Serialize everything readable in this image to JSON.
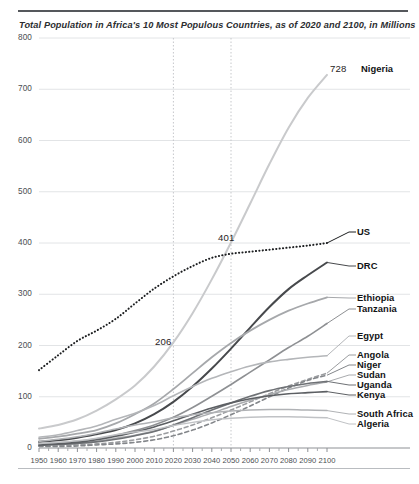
{
  "title": "Total Population in Africa's 10 Most Populous Countries, as of 2020 and 2100, in Millions",
  "annotations": [
    {
      "text": "728",
      "x": 2100,
      "y": 728
    },
    {
      "text": "401",
      "x": 2050,
      "y": 401
    },
    {
      "text": "206",
      "x": 2020,
      "y": 206
    }
  ],
  "chart_data": {
    "type": "line",
    "title": "Total Population in Africa's 10 Most Populous Countries, as of 2020 and 2100, in Millions",
    "xlabel": "",
    "ylabel": "",
    "xlim": [
      1950,
      2100
    ],
    "ylim": [
      0,
      800
    ],
    "yticks": [
      0,
      100,
      200,
      300,
      400,
      500,
      600,
      700,
      800
    ],
    "xticks": [
      1950,
      1960,
      1970,
      1980,
      1990,
      2000,
      2010,
      2020,
      2030,
      2040,
      2050,
      2060,
      2070,
      2080,
      2090,
      2100
    ],
    "grid": "horizontal-and-two-vertical",
    "vertical_gridlines": [
      2020,
      2050
    ],
    "legend": "right-inline-labels",
    "x": [
      1950,
      1960,
      1970,
      1980,
      1990,
      2000,
      2010,
      2020,
      2030,
      2040,
      2050,
      2060,
      2070,
      2080,
      2090,
      2100
    ],
    "series": [
      {
        "name": "Nigeria",
        "label": "Nigeria",
        "color": "#c9cacc",
        "style": "solid",
        "width": 2.0,
        "values": [
          38,
          45,
          56,
          73,
          95,
          122,
          159,
          206,
          263,
          329,
          401,
          477,
          554,
          625,
          683,
          728
        ]
      },
      {
        "name": "US",
        "label": "US",
        "color": "#1c1e20",
        "style": "dotted",
        "width": 2.0,
        "values": [
          152,
          181,
          209,
          229,
          252,
          282,
          311,
          335,
          355,
          371,
          379,
          383,
          387,
          391,
          395,
          400
        ]
      },
      {
        "name": "DRC",
        "label": "DRC",
        "color": "#47494c",
        "style": "solid",
        "width": 2.0,
        "values": [
          12,
          15,
          20,
          27,
          35,
          48,
          66,
          90,
          120,
          155,
          194,
          235,
          275,
          310,
          337,
          362
        ]
      },
      {
        "name": "Ethiopia",
        "label": "Ethiopia",
        "color": "#a6a8ab",
        "style": "solid",
        "width": 1.8,
        "values": [
          18,
          22,
          28,
          35,
          48,
          66,
          87,
          115,
          146,
          177,
          205,
          229,
          250,
          268,
          282,
          294
        ]
      },
      {
        "name": "Tanzania",
        "label": "Tanzania",
        "color": "#8e9093",
        "style": "solid",
        "width": 1.6,
        "values": [
          8,
          10,
          13,
          18,
          25,
          34,
          45,
          60,
          79,
          101,
          124,
          148,
          172,
          196,
          218,
          243
        ]
      },
      {
        "name": "Egypt",
        "label": "Egypt",
        "color": "#b4b6b9",
        "style": "solid",
        "width": 1.6,
        "values": [
          21,
          26,
          34,
          43,
          56,
          68,
          83,
          102,
          120,
          136,
          149,
          160,
          168,
          173,
          177,
          180
        ]
      },
      {
        "name": "Angola",
        "label": "Angola",
        "color": "#9b9da0",
        "style": "dashed",
        "width": 1.6,
        "values": [
          4,
          5,
          6,
          8,
          11,
          16,
          23,
          33,
          45,
          59,
          74,
          90,
          106,
          121,
          134,
          146
        ]
      },
      {
        "name": "Niger",
        "label": "Niger",
        "color": "#83868a",
        "style": "dashed",
        "width": 1.6,
        "values": [
          3,
          3,
          4,
          6,
          8,
          11,
          16,
          24,
          35,
          49,
          65,
          82,
          100,
          117,
          132,
          142
        ]
      },
      {
        "name": "Sudan",
        "label": "Sudan",
        "color": "#a9abae",
        "style": "solid",
        "width": 1.5,
        "values": [
          5,
          7,
          9,
          13,
          19,
          25,
          33,
          44,
          56,
          68,
          81,
          93,
          104,
          114,
          122,
          129
        ]
      },
      {
        "name": "Uganda",
        "label": "Uganda",
        "color": "#6e7175",
        "style": "solid",
        "width": 1.6,
        "values": [
          5,
          7,
          9,
          12,
          17,
          24,
          32,
          45,
          59,
          74,
          88,
          101,
          112,
          120,
          126,
          130
        ]
      },
      {
        "name": "Kenya",
        "label": "Kenya",
        "color": "#5c5f63",
        "style": "solid",
        "width": 1.6,
        "values": [
          6,
          8,
          11,
          16,
          23,
          31,
          41,
          53,
          66,
          78,
          88,
          96,
          102,
          106,
          108,
          110
        ]
      },
      {
        "name": "South Africa",
        "label": "South Africa",
        "color": "#b0b2b5",
        "style": "solid",
        "width": 1.5,
        "values": [
          13,
          17,
          22,
          29,
          37,
          45,
          51,
          59,
          65,
          69,
          72,
          74,
          75,
          75,
          74,
          73
        ]
      },
      {
        "name": "Algeria",
        "label": "Algeria",
        "color": "#c0c2c5",
        "style": "solid",
        "width": 1.5,
        "values": [
          9,
          11,
          14,
          19,
          26,
          31,
          36,
          44,
          50,
          55,
          58,
          60,
          61,
          61,
          60,
          59
        ]
      }
    ]
  },
  "labels_right": [
    {
      "name": "Nigeria",
      "top": 64
    },
    {
      "name": "US",
      "top": 227
    },
    {
      "name": "DRC",
      "top": 261
    },
    {
      "name": "Ethiopia",
      "top": 293
    },
    {
      "name": "Tanzania",
      "top": 304
    },
    {
      "name": "Egypt",
      "top": 331
    },
    {
      "name": "Angola",
      "top": 350
    },
    {
      "name": "Niger",
      "top": 360
    },
    {
      "name": "Sudan",
      "top": 370
    },
    {
      "name": "Uganda",
      "top": 380
    },
    {
      "name": "Kenya",
      "top": 390
    },
    {
      "name": "South Africa",
      "top": 409
    },
    {
      "name": "Algeria",
      "top": 419
    }
  ]
}
